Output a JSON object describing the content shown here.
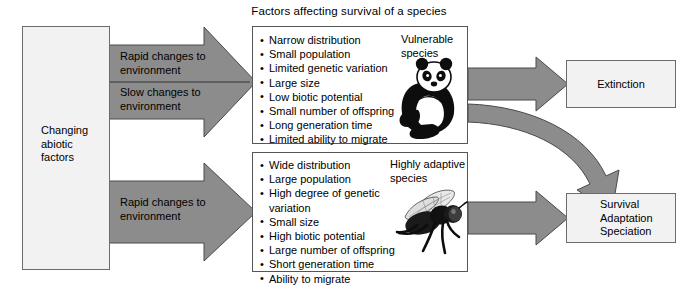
{
  "title": "Factors affecting survival of a species",
  "source_box": {
    "label": "Changing\nabiotic\nfactors"
  },
  "arrows": [
    {
      "name": "rapid-changes-top",
      "label": "Rapid changes to\nenvironment"
    },
    {
      "name": "slow-changes-top",
      "label": "Slow changes to\nenvironment"
    },
    {
      "name": "rapid-changes-bottom",
      "label": "Rapid changes to\nenvironment"
    }
  ],
  "vulnerable_panel": {
    "caption": "Vulnerable\nspecies",
    "icon": "panda-icon",
    "factors": [
      "Narrow distribution",
      "Small population",
      "Limited genetic variation",
      "Large size",
      "Low biotic potential",
      "Small number of offspring",
      "Long generation time",
      "Limited ability to migrate"
    ]
  },
  "adaptive_panel": {
    "caption": "Highly adaptive\nspecies",
    "icon": "fly-icon",
    "factors": [
      "Wide distribution",
      "Large population",
      "High degree of genetic\n   variation",
      "Small size",
      "High biotic potential",
      "Large number of offspring",
      "Short generation time",
      "Ability to migrate"
    ]
  },
  "outcomes": {
    "extinction": {
      "label": "Extinction"
    },
    "survival": {
      "label": "Survival\nAdaptation\nSpeciation"
    }
  },
  "colors": {
    "arrow_fill": "#8c8c8c",
    "arrow_stroke": "#4a4a4a",
    "box_fill": "#f2f2f2",
    "box_stroke": "#6b6b6b",
    "panel_fill": "#ffffff",
    "panel_stroke": "#555555",
    "text": "#000000"
  }
}
